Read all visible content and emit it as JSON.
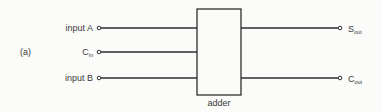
{
  "figure_label": "(a)",
  "block": {
    "label": "adder"
  },
  "inputs": [
    {
      "id": "input-a",
      "label": "input A",
      "subscript": ""
    },
    {
      "id": "carry-in",
      "label": "C",
      "subscript": "in"
    },
    {
      "id": "input-b",
      "label": "input B",
      "subscript": ""
    }
  ],
  "outputs": [
    {
      "id": "sum-out",
      "label": "S",
      "subscript": "out"
    },
    {
      "id": "carry-out",
      "label": "C",
      "subscript": "out"
    }
  ]
}
